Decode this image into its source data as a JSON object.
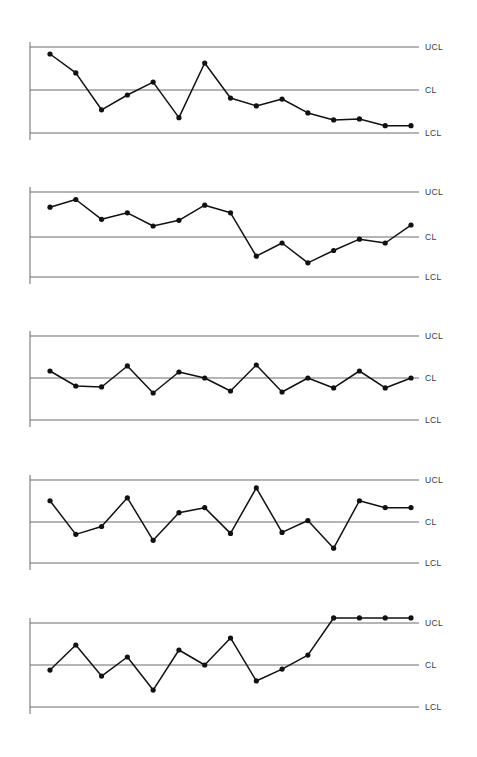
{
  "page": {
    "background_color": "#ffffff",
    "line_color": "#6b6b6b",
    "series_color": "#111111",
    "axis_color": "#6b6b6b",
    "label_color": "#3a3a3a",
    "width": 477,
    "height": 757
  },
  "labels": {
    "ucl": "UCL",
    "cl": "CL",
    "lcl": "LCL"
  },
  "chart_data": [
    {
      "type": "line",
      "title": "",
      "xlabel": "",
      "ylabel": "",
      "grid": false,
      "legend": "none",
      "reference_lines": [
        {
          "name": "UCL",
          "label": "UCL",
          "y": 3
        },
        {
          "name": "CL",
          "label": "CL",
          "y": 0
        },
        {
          "name": "LCL",
          "label": "LCL",
          "y": -3
        }
      ],
      "ylim": [
        -3,
        3
      ],
      "x": [
        1,
        2,
        3,
        4,
        5,
        6,
        7,
        8,
        9,
        10,
        11,
        12,
        13,
        14,
        15
      ],
      "values": [
        2.51,
        1.19,
        -1.38,
        -0.35,
        0.55,
        -1.93,
        1.88,
        -0.56,
        -1.11,
        -0.63,
        -1.6,
        -2.09,
        -2.02,
        -2.49,
        -2.49
      ],
      "annotation": "downward trend, shift below centre line"
    },
    {
      "type": "line",
      "title": "",
      "xlabel": "",
      "ylabel": "",
      "grid": false,
      "legend": "none",
      "reference_lines": [
        {
          "name": "UCL",
          "label": "UCL",
          "y": 3
        },
        {
          "name": "CL",
          "label": "CL",
          "y": 0
        },
        {
          "name": "LCL",
          "label": "LCL",
          "y": -3
        }
      ],
      "ylim": [
        -3,
        3
      ],
      "x": [
        1,
        2,
        3,
        4,
        5,
        6,
        7,
        8,
        9,
        10,
        11,
        12,
        13,
        14,
        15
      ],
      "values": [
        1.93,
        2.47,
        1.07,
        1.53,
        0.6,
        1.0,
        2.07,
        1.53,
        -1.53,
        -0.6,
        -2.0,
        -1.13,
        -0.33,
        -0.6,
        0.67
      ],
      "annotation": "process shift downward in second half"
    },
    {
      "type": "line",
      "title": "",
      "xlabel": "",
      "ylabel": "",
      "grid": false,
      "legend": "none",
      "reference_lines": [
        {
          "name": "UCL",
          "label": "UCL",
          "y": 3
        },
        {
          "name": "CL",
          "label": "CL",
          "y": 0
        },
        {
          "name": "LCL",
          "label": "LCL",
          "y": -3
        }
      ],
      "ylim": [
        -3,
        3
      ],
      "x": [
        1,
        2,
        3,
        4,
        5,
        6,
        7,
        8,
        9,
        10,
        11,
        12,
        13,
        14,
        15
      ],
      "values": [
        0.5,
        -0.57,
        -0.64,
        0.86,
        -1.07,
        0.43,
        0.0,
        -0.93,
        0.93,
        -1.0,
        0.0,
        -0.71,
        0.5,
        -0.71,
        0.0
      ],
      "annotation": "stable process, points hug centre line"
    },
    {
      "type": "line",
      "title": "",
      "xlabel": "",
      "ylabel": "",
      "grid": false,
      "legend": "none",
      "reference_lines": [
        {
          "name": "UCL",
          "label": "UCL",
          "y": 3
        },
        {
          "name": "CL",
          "label": "CL",
          "y": 0
        },
        {
          "name": "LCL",
          "label": "LCL",
          "y": -3
        }
      ],
      "ylim": [
        -3,
        3
      ],
      "x": [
        1,
        2,
        3,
        4,
        5,
        6,
        7,
        8,
        9,
        10,
        11,
        12,
        13,
        14,
        15
      ],
      "values": [
        1.5,
        -0.93,
        -0.36,
        1.71,
        -1.36,
        0.64,
        1.0,
        -0.86,
        2.43,
        -0.79,
        0.07,
        -1.93,
        1.5,
        1.0,
        1.0
      ],
      "annotation": "random variation within control limits"
    },
    {
      "type": "line",
      "title": "",
      "xlabel": "",
      "ylabel": "",
      "grid": false,
      "legend": "none",
      "reference_lines": [
        {
          "name": "UCL",
          "label": "UCL",
          "y": 3
        },
        {
          "name": "CL",
          "label": "CL",
          "y": 0
        },
        {
          "name": "LCL",
          "label": "LCL",
          "y": -3
        }
      ],
      "ylim": [
        -3,
        3
      ],
      "x": [
        1,
        2,
        3,
        4,
        5,
        6,
        7,
        8,
        9,
        10,
        11,
        12,
        13,
        14,
        15
      ],
      "values": [
        -0.36,
        1.43,
        -0.79,
        0.57,
        -1.79,
        1.07,
        0.0,
        1.93,
        -1.14,
        -0.29,
        0.71,
        3.36,
        3.36,
        3.36,
        3.36
      ],
      "annotation": "upward trend ending at upper control limit"
    }
  ]
}
